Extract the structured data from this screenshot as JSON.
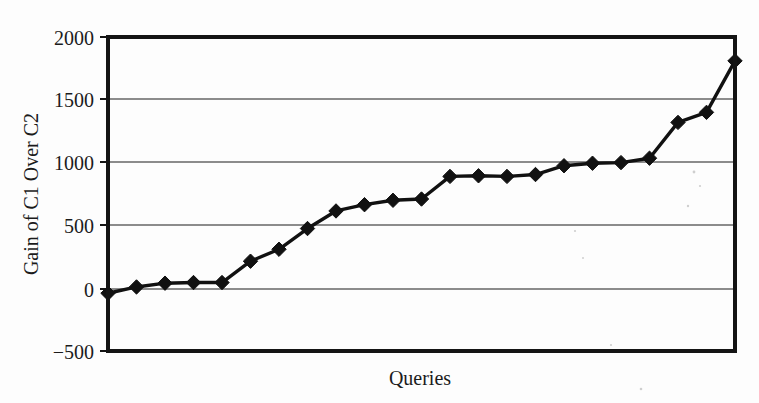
{
  "chart_data": {
    "type": "line",
    "title": "",
    "xlabel": "Queries",
    "ylabel": "Gain of C1 Over C2",
    "ylim": [
      -500,
      2000
    ],
    "yticks": [
      -500,
      0,
      500,
      1000,
      1500,
      2000
    ],
    "ytick_labels": [
      "−500",
      "0",
      "500",
      "1000",
      "1500",
      "2000"
    ],
    "xticks": [],
    "xtick_labels": [],
    "grid": "horizontal",
    "legend": "none",
    "marker": "diamond",
    "series": [
      {
        "name": "Gain of C1 Over C2",
        "color": "#111111",
        "x": [
          1,
          2,
          3,
          4,
          5,
          6,
          7,
          8,
          9,
          10,
          11,
          12,
          13,
          14,
          15,
          16,
          17,
          18,
          19,
          20,
          21,
          22
        ],
        "values": [
          -40,
          10,
          40,
          45,
          45,
          215,
          310,
          475,
          615,
          665,
          700,
          710,
          890,
          895,
          890,
          905,
          975,
          995,
          1000,
          1035,
          1320,
          1400
        ]
      }
    ],
    "final_point": {
      "x": 23,
      "value": 1810
    },
    "n_points": 23
  },
  "axis": {
    "y_label": "Gain of C1 Over C2",
    "x_label": "Queries"
  },
  "ticks": {
    "y": [
      "2000",
      "1500",
      "1000",
      "500",
      "0",
      "−500"
    ]
  },
  "colors": {
    "line": "#111111",
    "marker": "#111111",
    "grid": "#8c8c8c",
    "frame": "#141414",
    "background": "#fdfdfd"
  }
}
